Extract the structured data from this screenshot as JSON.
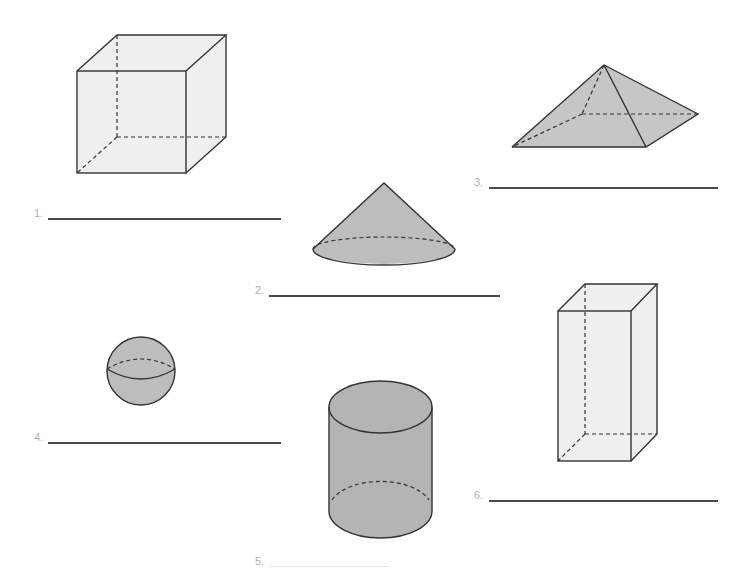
{
  "worksheet": {
    "items": [
      {
        "number": "1.",
        "shape": "cube-icon",
        "answer": ""
      },
      {
        "number": "2.",
        "shape": "cone-icon",
        "answer": ""
      },
      {
        "number": "3.",
        "shape": "square-pyramid-icon",
        "answer": ""
      },
      {
        "number": "4.",
        "shape": "sphere-icon",
        "answer": ""
      },
      {
        "number": "5.",
        "shape": "cylinder-icon",
        "answer": ""
      },
      {
        "number": "6.",
        "shape": "rectangular-prism-icon",
        "answer": ""
      }
    ]
  },
  "colors": {
    "light_fill": "#ececec",
    "dark_fill": "#b4b4b4",
    "outline": "#333333",
    "line": "#4a4a4a",
    "number_text": "#b0b0b0"
  }
}
